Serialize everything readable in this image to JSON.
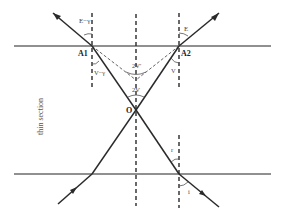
{
  "diagram": {
    "type": "optics-ray-diagram",
    "colors": {
      "background": "#ffffff",
      "surface_line": "#6b6b6b",
      "ray": "#2a2a2a",
      "normal_dashed": "#2a2a2a",
      "construction_dashed": "#555555",
      "text": "#444444"
    },
    "labels": {
      "A1": "A1",
      "A2": "A2",
      "O": "O",
      "angle_top_left": "E−γ",
      "angle_top_right": "E",
      "angle_mid_left": "V−γ",
      "angle_mid_right": "V",
      "angle_center_upper": "2V'",
      "angle_center_lower": "2V",
      "angle_bottom_r": "r",
      "angle_bottom_i": "i",
      "side_label": "thin section"
    },
    "surfaces": [
      {
        "name": "upper-surface",
        "x1": 14,
        "y1": 46,
        "x2": 271,
        "y2": 46
      },
      {
        "name": "lower-surface",
        "x1": 14,
        "y1": 174,
        "x2": 271,
        "y2": 174
      }
    ],
    "normals": [
      {
        "name": "normal-A1",
        "x1": 92,
        "y1": 13,
        "x2": 92,
        "y2": 87
      },
      {
        "name": "normal-A2",
        "x1": 179,
        "y1": 13,
        "x2": 179,
        "y2": 87
      },
      {
        "name": "normal-center",
        "x1": 136,
        "y1": 14,
        "x2": 136,
        "y2": 206
      },
      {
        "name": "normal-bottom",
        "x1": 179,
        "y1": 135,
        "x2": 179,
        "y2": 208
      }
    ],
    "rays": [
      {
        "name": "ray-out-left",
        "points": "92,46 53,13"
      },
      {
        "name": "ray-out-right",
        "points": "179,46 219,13"
      },
      {
        "name": "ray-A1-to-O",
        "points": "92,46 136,110"
      },
      {
        "name": "ray-A2-to-O",
        "points": "179,46 136,110"
      },
      {
        "name": "ray-O-to-bottom-right",
        "points": "136,110 179,174"
      },
      {
        "name": "ray-O-to-bottom-left",
        "points": "136,110 92,174"
      },
      {
        "name": "ray-in-left",
        "points": "92,174 58,204"
      },
      {
        "name": "ray-in-right",
        "points": "179,174 219,207"
      }
    ],
    "construction_lines": [
      {
        "name": "virtual-left",
        "x1": 92,
        "y1": 46,
        "x2": 136,
        "y2": 80
      },
      {
        "name": "virtual-right",
        "x1": 179,
        "y1": 46,
        "x2": 136,
        "y2": 80
      }
    ]
  }
}
